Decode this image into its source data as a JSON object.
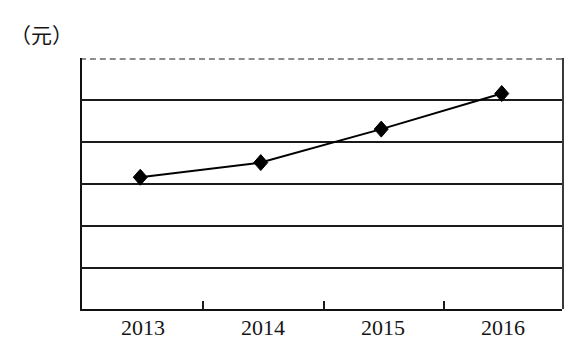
{
  "chart_data": {
    "type": "line",
    "title": "",
    "subtitle": "",
    "xlabel": "",
    "ylabel": "（元）",
    "unit_label": "（元）",
    "categories": [
      "2013",
      "2014",
      "2015",
      "2016"
    ],
    "series": [
      {
        "name": "",
        "values": [
          630,
          700,
          860,
          1030
        ],
        "marker": "diamond",
        "marker_color": "#000000",
        "line_color": "#000000"
      }
    ],
    "ylim": [
      0,
      1200
    ],
    "yticks": [
      0,
      200,
      400,
      600,
      800,
      1000,
      1200
    ],
    "ytick_labels": [
      "0",
      "200",
      "400",
      "600",
      "800",
      "1000",
      "1200"
    ],
    "xtick_labels": [
      "2013",
      "2014",
      "2015",
      "2016"
    ],
    "grid": true,
    "grid_orientation": "horizontal",
    "grid_color": "#1a1a1a",
    "legend": false,
    "legend_position": "none",
    "frame": {
      "top_border_style": "dashed",
      "top_border_color": "#8d8d8d",
      "axis_color": "#111111"
    },
    "background": "#ffffff"
  },
  "axes": {
    "y_unit": "（元）",
    "y_labels": [
      "1200",
      "1000",
      "800",
      "600",
      "400",
      "200",
      "0"
    ],
    "x_labels": [
      "2013",
      "2014",
      "2015",
      "2016"
    ]
  }
}
